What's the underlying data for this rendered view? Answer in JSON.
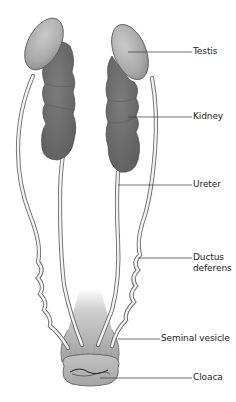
{
  "diagram": {
    "colors": {
      "background": "#ffffff",
      "testis_fill": "#a9a9a9",
      "testis_highlight": "#c6c6c6",
      "kidney_fill": "#6f6f6f",
      "kidney_shade": "#5a5a5a",
      "duct_fill": "#f2f2f2",
      "duct_outline": "#6a6a6a",
      "seminal_vesicle_fill": "#a2a2a2",
      "cloaca_fill": "#b3b3b3",
      "leader_line": "#333333",
      "label_text": "#222222"
    },
    "labels": [
      {
        "id": "testis",
        "text": "Testis",
        "x": 193,
        "y": 46,
        "line_from": [
          128,
          52
        ],
        "line_to": [
          192,
          52
        ]
      },
      {
        "id": "kidney",
        "text": "Kidney",
        "x": 193,
        "y": 111,
        "line_from": [
          128,
          117
        ],
        "line_to": [
          192,
          117
        ]
      },
      {
        "id": "ureter",
        "text": "Ureter",
        "x": 193,
        "y": 179,
        "line_from": [
          118,
          185
        ],
        "line_to": [
          192,
          185
        ]
      },
      {
        "id": "ductus-deferens",
        "text": "Ductus",
        "text2": "deferens",
        "x": 193,
        "y": 252,
        "line_from": [
          138,
          258
        ],
        "line_to": [
          192,
          258
        ]
      },
      {
        "id": "seminal-vesicle",
        "text": "Seminal vesicle",
        "x": 161,
        "y": 333,
        "line_from": [
          118,
          339
        ],
        "line_to": [
          160,
          339
        ]
      },
      {
        "id": "cloaca",
        "text": "Cloaca",
        "x": 193,
        "y": 372,
        "line_from": [
          100,
          378
        ],
        "line_to": [
          192,
          378
        ]
      }
    ]
  }
}
